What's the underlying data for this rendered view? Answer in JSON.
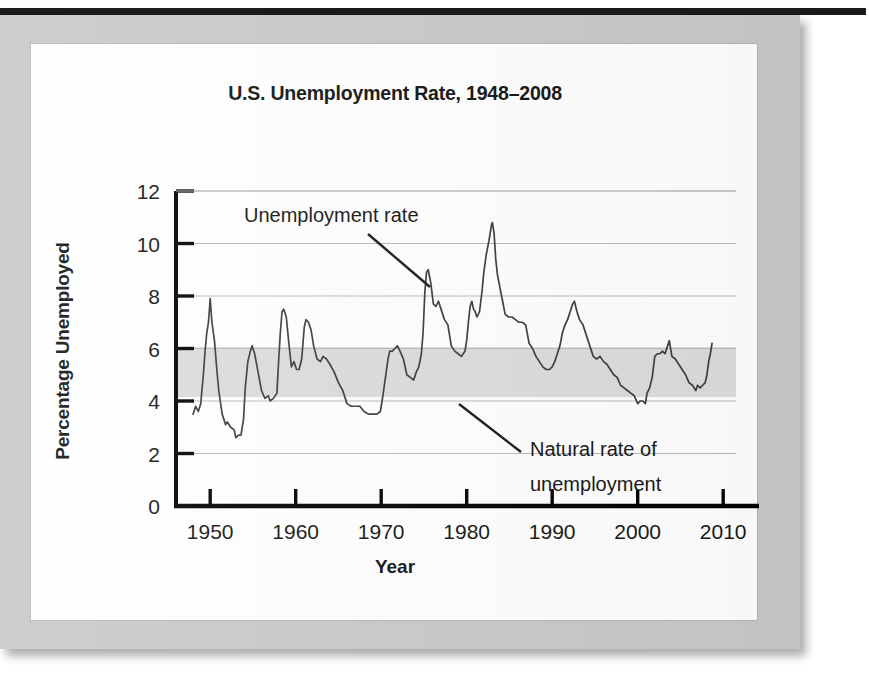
{
  "figure": {
    "title": "U.S. Unemployment Rate, 1948–2008",
    "x_axis_title": "Year",
    "y_axis_title": "Percentage Unemployed",
    "annotations": {
      "series_label": "Unemployment rate",
      "band_label_line1": "Natural rate of",
      "band_label_line2": "unemployment"
    },
    "colors": {
      "line": "#3c3c3c",
      "band_fill": "#dcdcdc",
      "gridline": "#b9b9b9",
      "axis": "#000000",
      "card_background": "#ffffff",
      "frame": "#c9c9c9",
      "top_bar": "#1b1b1b",
      "text": "#121212"
    }
  },
  "chart_data": {
    "type": "line",
    "title": "U.S. Unemployment Rate, 1948–2008",
    "xlabel": "Year",
    "ylabel": "Percentage Unemployed",
    "xlim": [
      1946,
      2011.5
    ],
    "ylim": [
      0,
      12
    ],
    "xticks": [
      1950,
      1960,
      1970,
      1980,
      1990,
      2000,
      2010
    ],
    "yticks": [
      0,
      2,
      4,
      6,
      8,
      10,
      12
    ],
    "xtick_labels": [
      "1950",
      "1960",
      "1970",
      "1980",
      "1990",
      "2000",
      "2010"
    ],
    "ytick_labels": [
      "0",
      "2",
      "4",
      "6",
      "8",
      "10",
      "12"
    ],
    "grid": "horizontal",
    "legend": "none",
    "bands": [
      {
        "name": "Natural rate of unemployment",
        "orientation": "horizontal",
        "y_min": 4.15,
        "y_max": 6.05,
        "fill": "#dcdcdc"
      }
    ],
    "series": [
      {
        "name": "Unemployment rate",
        "color": "#3c3c3c",
        "x": [
          1948.0,
          1948.3,
          1948.6,
          1948.9,
          1949.0,
          1949.2,
          1949.4,
          1949.6,
          1949.8,
          1950.0,
          1950.2,
          1950.5,
          1950.8,
          1951.0,
          1951.4,
          1951.8,
          1952.0,
          1952.4,
          1952.8,
          1953.0,
          1953.3,
          1953.6,
          1953.9,
          1954.1,
          1954.4,
          1954.7,
          1954.9,
          1955.2,
          1955.6,
          1956.0,
          1956.4,
          1956.8,
          1957.0,
          1957.4,
          1957.8,
          1958.0,
          1958.2,
          1958.4,
          1958.6,
          1958.9,
          1959.2,
          1959.5,
          1959.8,
          1960.1,
          1960.4,
          1960.7,
          1961.0,
          1961.2,
          1961.5,
          1961.8,
          1962.1,
          1962.5,
          1962.9,
          1963.2,
          1963.6,
          1964.0,
          1964.5,
          1965.0,
          1965.5,
          1966.0,
          1966.5,
          1967.0,
          1967.5,
          1968.0,
          1968.5,
          1969.0,
          1969.5,
          1969.9,
          1970.2,
          1970.5,
          1970.8,
          1971.0,
          1971.3,
          1971.6,
          1971.9,
          1972.2,
          1972.6,
          1973.0,
          1973.4,
          1973.8,
          1974.1,
          1974.4,
          1974.7,
          1974.9,
          1975.1,
          1975.3,
          1975.5,
          1975.8,
          1976.1,
          1976.4,
          1976.7,
          1977.0,
          1977.4,
          1977.8,
          1978.2,
          1978.6,
          1979.0,
          1979.4,
          1979.8,
          1980.0,
          1980.2,
          1980.4,
          1980.6,
          1980.8,
          1981.0,
          1981.2,
          1981.5,
          1981.8,
          1982.0,
          1982.3,
          1982.6,
          1982.9,
          1983.0,
          1983.2,
          1983.4,
          1983.6,
          1983.9,
          1984.2,
          1984.5,
          1984.9,
          1985.3,
          1985.7,
          1986.1,
          1986.5,
          1986.9,
          1987.3,
          1987.7,
          1988.1,
          1988.5,
          1988.9,
          1989.3,
          1989.7,
          1990.0,
          1990.3,
          1990.6,
          1990.9,
          1991.2,
          1991.5,
          1991.8,
          1992.1,
          1992.4,
          1992.6,
          1992.9,
          1993.2,
          1993.6,
          1994.0,
          1994.4,
          1994.8,
          1995.2,
          1995.6,
          1996.0,
          1996.4,
          1996.8,
          1997.2,
          1997.6,
          1998.0,
          1998.4,
          1998.8,
          1999.2,
          1999.6,
          2000.0,
          2000.3,
          2000.6,
          2000.9,
          2001.1,
          2001.4,
          2001.7,
          2002.0,
          2002.3,
          2002.6,
          2002.9,
          2003.2,
          2003.5,
          2003.7,
          2004.0,
          2004.4,
          2004.8,
          2005.2,
          2005.6,
          2006.0,
          2006.4,
          2006.8,
          2007.0,
          2007.3,
          2007.6,
          2007.9,
          2008.1,
          2008.3,
          2008.5,
          2008.7
        ],
        "y": [
          3.5,
          3.8,
          3.6,
          3.9,
          4.3,
          5.0,
          5.9,
          6.6,
          7.0,
          7.9,
          7.0,
          6.3,
          5.1,
          4.4,
          3.5,
          3.1,
          3.2,
          3.0,
          2.9,
          2.6,
          2.7,
          2.7,
          3.3,
          4.5,
          5.5,
          5.9,
          6.1,
          5.8,
          5.1,
          4.4,
          4.1,
          4.2,
          4.0,
          4.1,
          4.3,
          5.5,
          6.6,
          7.4,
          7.5,
          7.2,
          6.2,
          5.3,
          5.5,
          5.2,
          5.2,
          5.6,
          6.8,
          7.1,
          7.0,
          6.7,
          6.1,
          5.6,
          5.5,
          5.7,
          5.6,
          5.4,
          5.1,
          4.7,
          4.4,
          3.9,
          3.8,
          3.8,
          3.8,
          3.6,
          3.5,
          3.5,
          3.5,
          3.6,
          4.2,
          4.9,
          5.6,
          5.9,
          5.9,
          6.0,
          6.1,
          5.9,
          5.6,
          5.0,
          4.9,
          4.8,
          5.1,
          5.3,
          5.8,
          6.6,
          8.1,
          8.9,
          9.0,
          8.5,
          7.7,
          7.6,
          7.8,
          7.5,
          7.1,
          6.9,
          6.1,
          5.9,
          5.8,
          5.7,
          5.9,
          6.3,
          7.0,
          7.6,
          7.8,
          7.5,
          7.4,
          7.2,
          7.4,
          8.2,
          8.9,
          9.6,
          10.1,
          10.7,
          10.8,
          10.4,
          9.4,
          8.8,
          8.3,
          7.8,
          7.3,
          7.2,
          7.2,
          7.1,
          7.0,
          7.0,
          6.9,
          6.2,
          6.0,
          5.7,
          5.5,
          5.3,
          5.2,
          5.2,
          5.3,
          5.5,
          5.8,
          6.1,
          6.6,
          6.9,
          7.1,
          7.4,
          7.7,
          7.8,
          7.4,
          7.1,
          6.9,
          6.5,
          6.1,
          5.7,
          5.6,
          5.7,
          5.5,
          5.4,
          5.2,
          5.0,
          4.9,
          4.6,
          4.5,
          4.4,
          4.3,
          4.2,
          3.9,
          4.0,
          4.0,
          3.9,
          4.3,
          4.5,
          4.9,
          5.7,
          5.8,
          5.8,
          5.9,
          5.8,
          6.1,
          6.3,
          5.7,
          5.6,
          5.4,
          5.2,
          5.0,
          4.7,
          4.6,
          4.4,
          4.6,
          4.5,
          4.6,
          4.7,
          5.0,
          5.5,
          5.8,
          6.2
        ]
      }
    ]
  }
}
